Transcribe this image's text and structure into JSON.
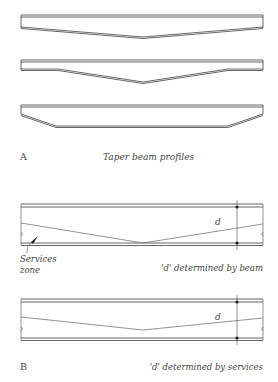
{
  "figure": {
    "part_a": {
      "label": "A",
      "caption": "Taper beam profiles",
      "profiles": [
        {
          "name": "taper-profile-1",
          "description": "Linear taper from ends to midspan"
        },
        {
          "name": "taper-profile-2",
          "description": "Constant depth near ends, taper to midspan"
        },
        {
          "name": "taper-profile-3",
          "description": "Haunched ends, constant depth in middle"
        }
      ]
    },
    "part_b": {
      "label": "B",
      "case_beam": {
        "dimension_label": "d",
        "annotation": "Services zone",
        "annotation_line1": "Services",
        "annotation_line2": "zone",
        "caption": "'d' determined by beam"
      },
      "case_services": {
        "dimension_label": "d",
        "caption": "'d' determined by services"
      }
    }
  },
  "colors": {
    "line": "#555555",
    "text": "#444444",
    "background": "#ffffff"
  }
}
